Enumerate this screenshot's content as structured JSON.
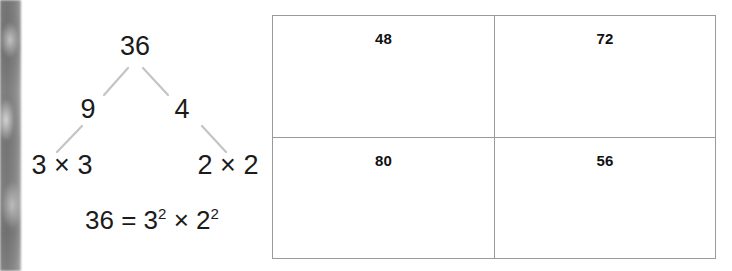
{
  "worksheet": {
    "factor_tree": {
      "root": "36",
      "left_branch": "9",
      "right_branch": "4",
      "left_leaf": "3 × 3",
      "right_leaf": "2 × 2",
      "equation": {
        "base": "36 = 3",
        "exp1": "2",
        "middle": " × 2",
        "exp2": "2",
        "full_text": "36 = 3² × 2²"
      },
      "line_color": "#c4c4c4",
      "text_color": "#1b1b1b"
    },
    "answer_grid": {
      "border_color": "#9a9a9a",
      "columns": 2,
      "rows": 2,
      "cells": [
        {
          "value": "48"
        },
        {
          "value": "72"
        },
        {
          "value": "80"
        },
        {
          "value": "56"
        }
      ]
    }
  }
}
